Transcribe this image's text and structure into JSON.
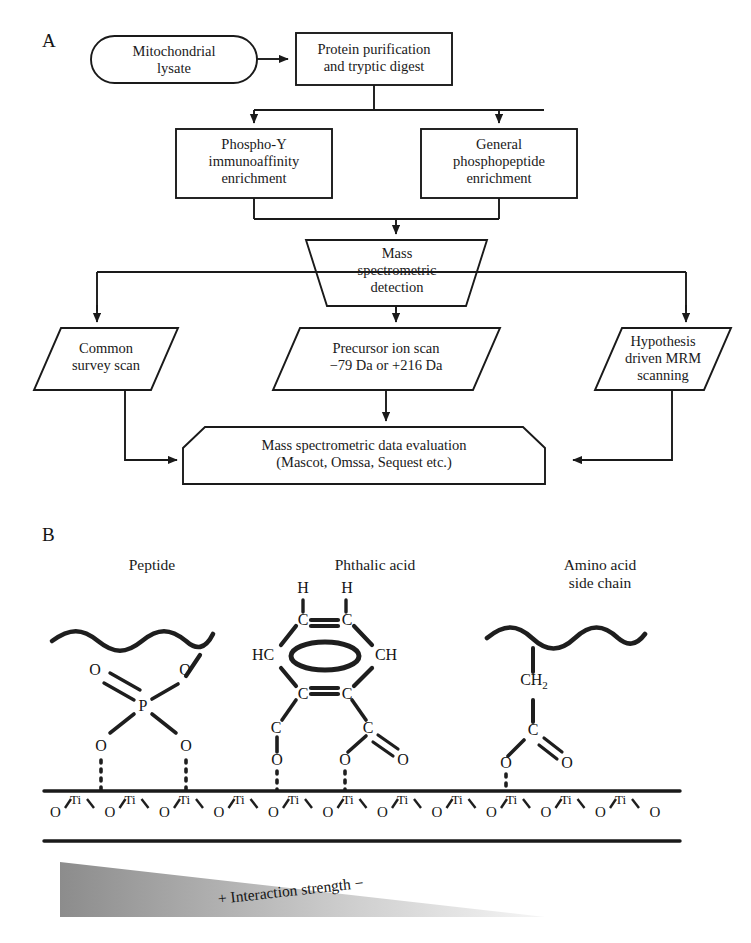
{
  "figure": {
    "panels": [
      {
        "letter": "A",
        "name": "workflow-flowchart"
      },
      {
        "letter": "B",
        "name": "binding-chemistry-diagram"
      }
    ]
  },
  "panel_a": {
    "letter": "A",
    "nodes": [
      {
        "id": "lysate",
        "shape": "stadium",
        "label": "Mitochondrial\nlysate"
      },
      {
        "id": "purification",
        "shape": "rect",
        "label": "Protein purification\nand tryptic digest"
      },
      {
        "id": "phosphoy",
        "shape": "rect",
        "label": "Phospho-Y\nimmunoaffinity\nenrichment"
      },
      {
        "id": "general",
        "shape": "rect",
        "label": "General\nphosphopeptide\nenrichment"
      },
      {
        "id": "msdetect",
        "shape": "trapezoid",
        "label": "Mass\nspectrometric\ndetection"
      },
      {
        "id": "survey",
        "shape": "parallelogram",
        "label": "Common\nsurvey scan"
      },
      {
        "id": "precursor",
        "shape": "parallelogram",
        "label": "Precursor ion scan\n−79 Da or +216 Da"
      },
      {
        "id": "mrm",
        "shape": "parallelogram",
        "label": "Hypothesis\ndriven MRM\nscanning"
      },
      {
        "id": "evaluation",
        "shape": "chamfered",
        "label": "Mass spectrometric data evaluation\n(Mascot, Omssa, Sequest etc.)"
      }
    ]
  },
  "panel_b": {
    "letter": "B",
    "headings": [
      {
        "id": "peptide",
        "label": "Peptide"
      },
      {
        "id": "phthalic",
        "label": "Phthalic acid"
      },
      {
        "id": "amino",
        "label": "Amino acid\nside chain"
      }
    ],
    "peptide_group": {
      "atoms": [
        "O",
        "O",
        "P",
        "O",
        "O"
      ]
    },
    "phthalic_group": {
      "ring_top_h": [
        "H",
        "H"
      ],
      "ring_atoms": [
        "C",
        "C",
        "HC",
        "CH",
        "C",
        "C"
      ],
      "carboxyl_atoms": [
        "C",
        "C",
        "O",
        "O",
        "O"
      ]
    },
    "amino_group": {
      "atoms": [
        "CH",
        "2",
        "C",
        "O",
        "O"
      ],
      "ch2_label": "CH",
      "ch2_sub": "2",
      "carbon": "C",
      "oxygen_left": "O",
      "oxygen_right": "O"
    },
    "surface": {
      "titanium_label": "Ti",
      "oxygen_label": "O",
      "ti_count": 11,
      "o_count": 12
    },
    "gradient": {
      "caption": "+ Interaction strength −",
      "plus": "+",
      "text": "Interaction strength",
      "minus": "−",
      "dark_color": "#8c8c8c",
      "light_color": "#f4f4f4"
    }
  },
  "colors": {
    "stroke": "#1a1a1a",
    "text": "#151515",
    "background": "#ffffff"
  }
}
